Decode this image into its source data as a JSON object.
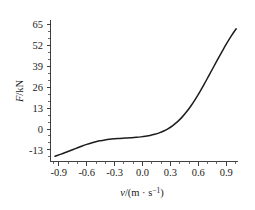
{
  "chart_data": {
    "type": "line",
    "title": "",
    "subtitle": "",
    "xlabel": "v/(m · s⁻¹)",
    "ylabel": "F/kN",
    "xlim": [
      -1.05,
      1.02
    ],
    "ylim": [
      -19.5,
      69.0
    ],
    "grid": false,
    "legend": null,
    "legend_position": "none",
    "xticks": [
      "-0.9",
      "-0.6",
      "-0.3",
      "0.0",
      "0.3",
      "0.6",
      "0.9"
    ],
    "xtick_values": [
      -0.9,
      -0.6,
      -0.3,
      0.0,
      0.3,
      0.6,
      0.9
    ],
    "x_minor_tick_step": 0.1,
    "yticks": [
      "65",
      "52",
      "39",
      "26",
      "13",
      "0",
      "-13"
    ],
    "ytick_values": [
      65,
      52,
      39,
      26,
      13,
      0,
      -13
    ],
    "series": [
      {
        "name": "F(v)",
        "color": "#1c1c1c",
        "x": [
          -1.0,
          -0.95,
          -0.9,
          -0.85,
          -0.8,
          -0.75,
          -0.7,
          -0.65,
          -0.6,
          -0.55,
          -0.5,
          -0.45,
          -0.4,
          -0.35,
          -0.3,
          -0.25,
          -0.2,
          -0.15,
          -0.1,
          -0.05,
          0.0,
          0.05,
          0.1,
          0.15,
          0.2,
          0.25,
          0.3,
          0.35,
          0.4,
          0.45,
          0.5,
          0.55,
          0.6,
          0.65,
          0.7,
          0.75,
          0.8,
          0.85,
          0.9,
          0.95,
          1.0
        ],
        "y": [
          -16.2,
          -15.2,
          -14.2,
          -13.1,
          -12.0,
          -10.9,
          -9.8,
          -8.8,
          -7.9,
          -7.1,
          -6.5,
          -6.0,
          -5.6,
          -5.3,
          -5.1,
          -4.9,
          -4.8,
          -4.6,
          -4.4,
          -4.1,
          -3.7,
          -3.2,
          -2.5,
          -1.6,
          -0.4,
          1.1,
          3.0,
          5.3,
          8.1,
          11.4,
          15.2,
          19.5,
          24.2,
          29.2,
          34.4,
          39.6,
          44.8,
          49.9,
          54.8,
          59.4,
          63.5
        ]
      }
    ]
  },
  "axis": {
    "y_title_main": "F",
    "y_title_rest": "/kN",
    "x_title_var": "v",
    "x_title_open": "/(m · s",
    "x_title_exp": "−1",
    "x_title_close": ")"
  }
}
